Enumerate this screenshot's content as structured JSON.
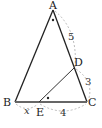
{
  "figure": {
    "type": "triangle-geometry",
    "points": {
      "A": {
        "label": "A",
        "x": 53,
        "y": 10
      },
      "B": {
        "label": "B",
        "x": 15,
        "y": 102
      },
      "C": {
        "label": "C",
        "x": 87,
        "y": 102
      },
      "D": {
        "label": "D",
        "x": 74,
        "y": 68
      },
      "E": {
        "label": "E",
        "x": 39,
        "y": 102
      }
    },
    "segments": [
      "AB",
      "AC",
      "BC",
      "DE"
    ],
    "measures": {
      "AD": "5",
      "DC": "3",
      "BE": "x",
      "EC": "4"
    },
    "angle_marks": [
      "angle BAC",
      "angle DEC"
    ],
    "colors": {
      "line": "#222222",
      "base": "#666666",
      "dashed": "#aaaaaa"
    }
  }
}
